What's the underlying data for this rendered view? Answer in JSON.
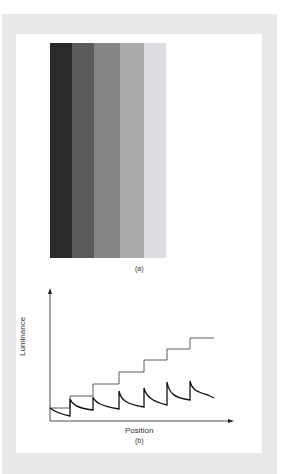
{
  "figure": {
    "panel_a": {
      "label": "(a)",
      "stripes": [
        {
          "color": "#2a2a2c",
          "width": 22
        },
        {
          "color": "#5a5a5c",
          "width": 22
        },
        {
          "color": "#858587",
          "width": 26
        },
        {
          "color": "#ababad",
          "width": 24
        },
        {
          "color": "#dcdce0",
          "width": 22
        }
      ]
    },
    "panel_b": {
      "label": "(b)",
      "y_axis_label": "Luminance",
      "x_axis_label": "Position"
    }
  }
}
